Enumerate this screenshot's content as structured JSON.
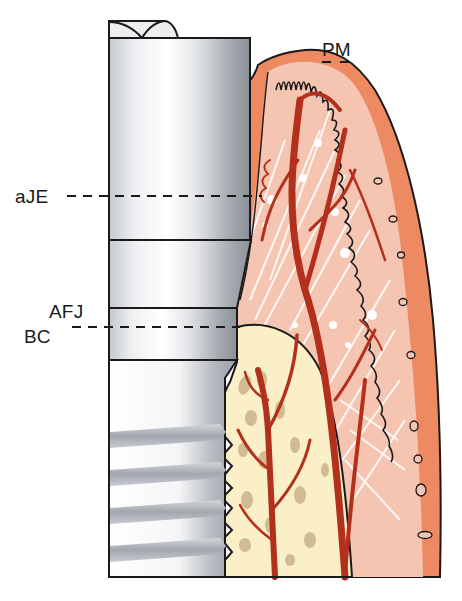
{
  "figure": {
    "type": "anatomical-diagram",
    "colors": {
      "implant_light": "#f4f5f7",
      "implant_mid": "#c9ccd2",
      "implant_dark": "#8d9199",
      "oral_epithelium": "#ee8a62",
      "connective_tissue": "#f5c5b2",
      "bone": "#fbefc8",
      "bone_trabeculae": "#c9b38a",
      "vessels": "#b3301c",
      "outline": "#1a1a1a"
    }
  },
  "labels": {
    "pm": "PM",
    "aje": "aJE",
    "afj": "AFJ",
    "bc": "BC"
  }
}
